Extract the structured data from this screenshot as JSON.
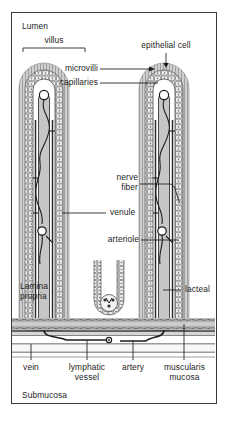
{
  "figure": {
    "background_color": "#ffffff",
    "frame_color": "#3a3a3a",
    "ink_color": "#1d1d1d",
    "tissue_fill": "#d8d8d8",
    "vessel_fill": "#b8b8b8"
  },
  "labels": {
    "lumen": "Lumen",
    "villus": "villus",
    "epithelial_cell": "epithelial cell",
    "microvilli": "microvilli",
    "capillaries": "capillaries",
    "nerve_fiber_line1": "nerve",
    "nerve_fiber_line2": "fiber",
    "venule": "venule",
    "arteriole": "arteriole",
    "lamina_propria_line1": "Lamina",
    "lamina_propria_line2": "propria",
    "lacteal": "lacteal",
    "vein": "vein",
    "lymphatic_vessel_line1": "lymphatic",
    "lymphatic_vessel_line2": "vessel",
    "artery": "artery",
    "muscularis_mucosa_line1": "muscularis",
    "muscularis_mucosa_line2": "mucosa",
    "submucosa": "Submucosa"
  },
  "structures": [
    {
      "name": "villus-left",
      "type": "villus"
    },
    {
      "name": "villus-right",
      "type": "villus"
    },
    {
      "name": "crypt-center",
      "type": "intestinal-crypt"
    },
    {
      "name": "muscularis-mucosae-band",
      "type": "muscle-layer"
    },
    {
      "name": "submucosa-region",
      "type": "tissue-region"
    },
    {
      "name": "lamina-propria-region",
      "type": "tissue-region"
    },
    {
      "name": "lumen-region",
      "type": "space"
    }
  ]
}
